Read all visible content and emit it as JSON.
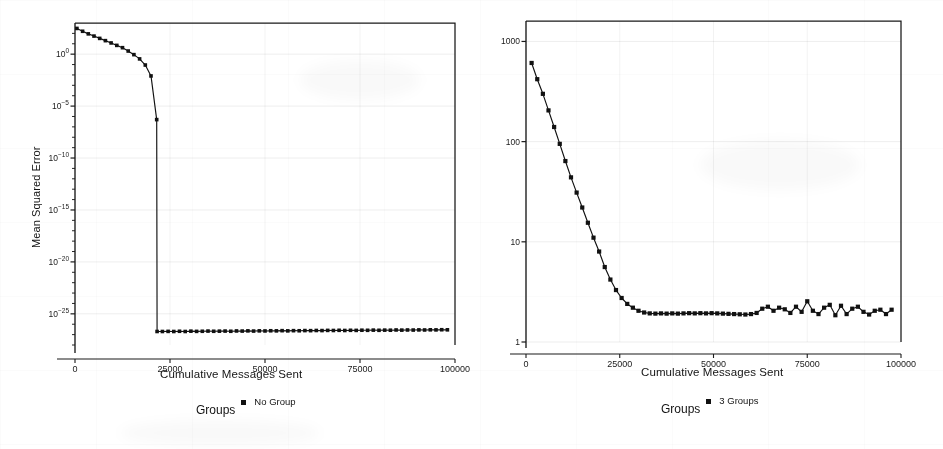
{
  "figure": {
    "background_color": "#ffffff",
    "ink_color": "#111111",
    "panel_count": 2
  },
  "panels": [
    {
      "id": "left",
      "axis": {
        "ylabel": "Mean Squared Error",
        "xlabel": "Cumulative Messages Sent",
        "yticks": [
          "10^0",
          "10^-5",
          "10^-10",
          "10^-15",
          "10^-20",
          "10^-25"
        ],
        "ytick_mantissas": [
          "10",
          "10",
          "10",
          "10",
          "10",
          "10"
        ],
        "ytick_exponents": [
          "0",
          "-5",
          "-10",
          "-15",
          "-20",
          "-25"
        ],
        "xticks": [
          "0",
          "25000",
          "50000",
          "75000",
          "100000"
        ]
      },
      "legend": {
        "title": "Groups",
        "entries": [
          {
            "label": "No Group",
            "marker": "square",
            "color": "#111111"
          }
        ]
      }
    },
    {
      "id": "right",
      "axis": {
        "ylabel": "Mean Squared Error",
        "xlabel": "Cumulative Messages Sent",
        "yticks": [
          "1000",
          "100",
          "10",
          "1"
        ],
        "xticks": [
          "0",
          "25000",
          "50000",
          "75000",
          "100000"
        ]
      },
      "legend": {
        "title": "Groups",
        "entries": [
          {
            "label": "3 Groups",
            "marker": "square",
            "color": "#111111"
          }
        ]
      }
    }
  ],
  "chart_data": [
    {
      "type": "line",
      "id": "left-no-group",
      "title": "",
      "xlabel": "Cumulative Messages Sent",
      "ylabel": "Mean Squared Error",
      "yscale": "log",
      "xlim": [
        0,
        100000
      ],
      "ylim": [
        1e-28,
        1000
      ],
      "grid": true,
      "legend_position": "below",
      "series": [
        {
          "name": "No Group",
          "marker": "square",
          "color": "#111111",
          "x": [
            500,
            2000,
            3500,
            5000,
            6500,
            8000,
            9500,
            11000,
            12500,
            14000,
            15500,
            17000,
            18500,
            20000,
            21500,
            21600,
            23000,
            24500,
            26000,
            27500,
            29000,
            30500,
            32000,
            33500,
            35000,
            36500,
            38000,
            39500,
            41000,
            42500,
            44000,
            45500,
            47000,
            48500,
            50000,
            51500,
            53000,
            54500,
            56000,
            57500,
            59000,
            60500,
            62000,
            63500,
            65000,
            66500,
            68000,
            69500,
            71000,
            72500,
            74000,
            75500,
            77000,
            78500,
            80000,
            81500,
            83000,
            84500,
            86000,
            87500,
            89000,
            90500,
            92000,
            93500,
            95000,
            96500,
            98000
          ],
          "y": [
            300,
            160,
            90,
            55,
            33,
            20,
            12,
            7,
            4.2,
            2.0,
            0.9,
            0.35,
            0.09,
            0.008,
            5e-07,
            2e-27,
            2e-27,
            2.05e-27,
            2e-27,
            2.1e-27,
            2e-27,
            2.15e-27,
            2.05e-27,
            2.1e-27,
            2.2e-27,
            2.1e-27,
            2.15e-27,
            2.2e-27,
            2.1e-27,
            2.25e-27,
            2.2e-27,
            2.3e-27,
            2.2e-27,
            2.3e-27,
            2.25e-27,
            2.35e-27,
            2.3e-27,
            2.4e-27,
            2.3e-27,
            2.4e-27,
            2.35e-27,
            2.45e-27,
            2.4e-27,
            2.5e-27,
            2.45e-27,
            2.55e-27,
            2.5e-27,
            2.6e-27,
            2.5e-27,
            2.6e-27,
            2.55e-27,
            2.65e-27,
            2.6e-27,
            2.7e-27,
            2.6e-27,
            2.7e-27,
            2.65e-27,
            2.8e-27,
            2.7e-27,
            2.8e-27,
            2.75e-27,
            2.85e-27,
            2.8e-27,
            2.9e-27,
            2.85e-27,
            2.95e-27,
            2.9e-27
          ]
        }
      ]
    },
    {
      "type": "line",
      "id": "right-3-groups",
      "title": "",
      "xlabel": "Cumulative Messages Sent",
      "ylabel": "Mean Squared Error",
      "yscale": "log",
      "xlim": [
        0,
        100000
      ],
      "ylim": [
        1,
        1600
      ],
      "grid": true,
      "legend_position": "below",
      "series": [
        {
          "name": "3 Groups",
          "marker": "square",
          "color": "#111111",
          "x": [
            1500,
            3000,
            4500,
            6000,
            7500,
            9000,
            10500,
            12000,
            13500,
            15000,
            16500,
            18000,
            19500,
            21000,
            22500,
            24000,
            25500,
            27000,
            28500,
            30000,
            31500,
            33000,
            34500,
            36000,
            37500,
            39000,
            40500,
            42000,
            43500,
            45000,
            46500,
            48000,
            49500,
            51000,
            52500,
            54000,
            55500,
            57000,
            58500,
            60000,
            61500,
            63000,
            64500,
            66000,
            67500,
            69000,
            70500,
            72000,
            73500,
            75000,
            76500,
            78000,
            79500,
            81000,
            82500,
            84000,
            85500,
            87000,
            88500,
            90000,
            91500,
            93000,
            94500,
            96000,
            97500
          ],
          "y": [
            610,
            420,
            300,
            205,
            140,
            95,
            64,
            44,
            31,
            22,
            15.5,
            11.0,
            8.0,
            5.6,
            4.2,
            3.3,
            2.75,
            2.4,
            2.2,
            2.05,
            1.97,
            1.93,
            1.92,
            1.93,
            1.92,
            1.93,
            1.92,
            1.93,
            1.94,
            1.93,
            1.94,
            1.93,
            1.94,
            1.93,
            1.92,
            1.91,
            1.9,
            1.89,
            1.88,
            1.9,
            1.95,
            2.15,
            2.25,
            2.05,
            2.2,
            2.12,
            1.95,
            2.25,
            2.0,
            2.55,
            2.05,
            1.9,
            2.2,
            2.35,
            1.85,
            2.3,
            1.9,
            2.15,
            2.25,
            2.0,
            1.88,
            2.05,
            2.1,
            1.9,
            2.1
          ]
        }
      ]
    }
  ]
}
